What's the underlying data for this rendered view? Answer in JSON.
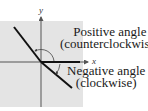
{
  "diagram": {
    "axes": {
      "x_label": "x",
      "y_label": "y"
    },
    "positive_angle": {
      "line1": "Positive angle",
      "line2": "(counterclockwise)"
    },
    "negative_angle": {
      "line1": "Negative angle",
      "line2": "(clockwise)"
    },
    "colors": {
      "background_square": "#e4e4e4",
      "lines": "#111111",
      "axes": "#555555"
    }
  }
}
